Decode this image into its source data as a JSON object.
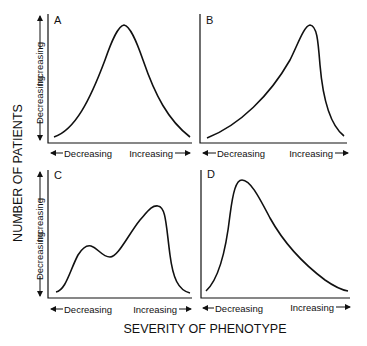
{
  "figure": {
    "y_axis_title": "NUMBER OF PATIENTS",
    "x_axis_title": "SEVERITY OF PHENOTYPE",
    "x_low_label": "Decreasing",
    "x_high_label": "Increasing",
    "y_low_label": "Decreasing",
    "y_high_label": "Increasing",
    "panels": [
      {
        "id": "A",
        "label": "A",
        "shape": "symmetric unimodal bell curve"
      },
      {
        "id": "B",
        "label": "B",
        "shape": "left-skewed unimodal, peak toward increasing severity"
      },
      {
        "id": "C",
        "label": "C",
        "shape": "bimodal, smaller peak at lower severity, larger peak at higher severity"
      },
      {
        "id": "D",
        "label": "D",
        "shape": "right-skewed unimodal, peak toward decreasing severity"
      }
    ],
    "line_color": "#111111",
    "background": "#ffffff"
  }
}
